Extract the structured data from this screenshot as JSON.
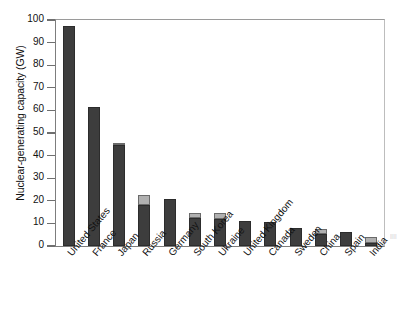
{
  "chart_data": {
    "type": "bar",
    "title": "",
    "subtitle": "",
    "xlabel": "",
    "ylabel": "Nuclear-generating capacity (GW)",
    "ylim": [
      0,
      100
    ],
    "ytick_step": 10,
    "yticks": [
      "100",
      "90",
      "80",
      "70",
      "60",
      "50",
      "40",
      "30",
      "20",
      "10",
      "0"
    ],
    "grid": false,
    "legend": "none",
    "stacked": true,
    "categories": [
      "United States",
      "France",
      "Japan",
      "Russia",
      "Germany",
      "South Korea",
      "Ukraine",
      "United Kingdom",
      "Canada",
      "Sweden",
      "China",
      "Spain",
      "India"
    ],
    "series": [
      {
        "name": "operating",
        "color": "#3d3d3d",
        "values": [
          97.5,
          61.5,
          44.5,
          18.0,
          21.0,
          12.5,
          12.0,
          11.0,
          10.5,
          8.0,
          5.5,
          6.0,
          1.5
        ]
      },
      {
        "name": "under-construction",
        "color": "#b0b0b0",
        "values": [
          0,
          0,
          0.8,
          4.5,
          0,
          2.0,
          2.5,
          0,
          0,
          0,
          2.0,
          0,
          2.5
        ]
      }
    ],
    "totals": [
      97.5,
      61.5,
      45.3,
      22.5,
      21.0,
      14.5,
      14.5,
      11.0,
      10.5,
      8.0,
      7.5,
      6.0,
      4.0
    ]
  },
  "page_edge_text": "|||||"
}
